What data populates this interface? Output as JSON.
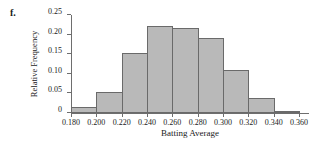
{
  "figure": {
    "part_label": "f."
  },
  "chart_data": {
    "type": "bar",
    "title": "",
    "xlabel": "Batting Average",
    "ylabel": "Relative Frequency",
    "categories": [
      "0.180-0.200",
      "0.200-0.220",
      "0.220-0.240",
      "0.240-0.260",
      "0.260-0.280",
      "0.280-0.300",
      "0.300-0.320",
      "0.320-0.340",
      "0.340-0.360"
    ],
    "bin_edges": [
      0.18,
      0.2,
      0.22,
      0.24,
      0.26,
      0.28,
      0.3,
      0.32,
      0.34,
      0.36
    ],
    "values": [
      0.016,
      0.053,
      0.154,
      0.221,
      0.218,
      0.191,
      0.11,
      0.039,
      0.005
    ],
    "xlim": [
      0.18,
      0.36
    ],
    "ylim": [
      0,
      0.25
    ],
    "xticks": [
      0.18,
      0.2,
      0.22,
      0.24,
      0.26,
      0.28,
      0.3,
      0.32,
      0.34,
      0.36
    ],
    "xtick_labels": [
      "0.180",
      "0.200",
      "0.220",
      "0.240",
      "0.260",
      "0.280",
      "0.300",
      "0.320",
      "0.340",
      "0.360"
    ],
    "yticks": [
      0,
      0.05,
      0.1,
      0.15,
      0.2,
      0.25
    ],
    "ytick_labels": [
      "0",
      "0.05",
      "0.10",
      "0.15",
      "0.20",
      "0.25"
    ],
    "grid": false,
    "legend": false,
    "bar_fill_color": "#b9b9b9",
    "bar_edge_color": "#6a6a6a",
    "axis_color": "#6e6e6e"
  }
}
